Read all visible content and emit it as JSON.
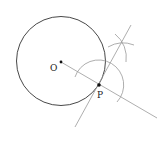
{
  "diagram": {
    "labels": {
      "center": "O",
      "point": "P"
    },
    "colors": {
      "circle": "#333333",
      "construction": "#888888",
      "point": "#111111"
    }
  }
}
